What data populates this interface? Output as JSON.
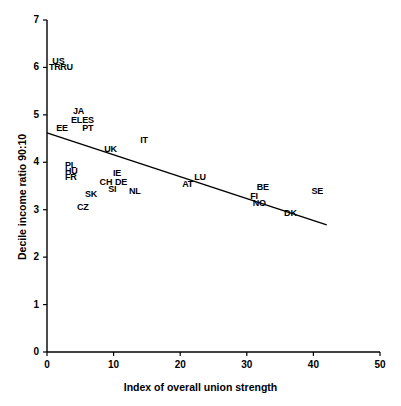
{
  "chart_data": {
    "type": "scatter",
    "title": "",
    "xlabel": "Index of overall union strength",
    "ylabel": "Decile income ratio 90:10",
    "xlim": [
      0,
      50
    ],
    "ylim": [
      0,
      7
    ],
    "xticks": [
      "0",
      "10",
      "20",
      "30",
      "40",
      "50"
    ],
    "yticks": [
      "0",
      "1",
      "2",
      "3",
      "4",
      "5",
      "6",
      "7"
    ],
    "grid": false,
    "legend": "none",
    "marker": "text-label-only",
    "points": [
      {
        "label": "US",
        "x": 0.5,
        "y": 6.12
      },
      {
        "label": "TR",
        "x": 0.0,
        "y": 5.98
      },
      {
        "label": "RU",
        "x": 1.7,
        "y": 5.98
      },
      {
        "label": "JA",
        "x": 3.6,
        "y": 5.06
      },
      {
        "label": "EL",
        "x": 3.3,
        "y": 4.88
      },
      {
        "label": "ES",
        "x": 5.0,
        "y": 4.88
      },
      {
        "label": "EE",
        "x": 1.1,
        "y": 4.71
      },
      {
        "label": "PT",
        "x": 5.0,
        "y": 4.71
      },
      {
        "label": "IT",
        "x": 13.7,
        "y": 4.45
      },
      {
        "label": "UK",
        "x": 8.3,
        "y": 4.25
      },
      {
        "label": "PL",
        "x": 2.4,
        "y": 3.93
      },
      {
        "label": "HU",
        "x": 2.4,
        "y": 3.79
      },
      {
        "label": "IE",
        "x": 9.6,
        "y": 3.76
      },
      {
        "label": "FR",
        "x": 2.4,
        "y": 3.66
      },
      {
        "label": "LU",
        "x": 21.8,
        "y": 3.66
      },
      {
        "label": "CH",
        "x": 7.6,
        "y": 3.57
      },
      {
        "label": "DE",
        "x": 9.9,
        "y": 3.57
      },
      {
        "label": "AT",
        "x": 20.0,
        "y": 3.53
      },
      {
        "label": "BE",
        "x": 31.2,
        "y": 3.46
      },
      {
        "label": "SI",
        "x": 8.9,
        "y": 3.41
      },
      {
        "label": "NL",
        "x": 12.0,
        "y": 3.37
      },
      {
        "label": "SE",
        "x": 39.4,
        "y": 3.37
      },
      {
        "label": "SK",
        "x": 5.4,
        "y": 3.3
      },
      {
        "label": "FI",
        "x": 30.2,
        "y": 3.26
      },
      {
        "label": "NO",
        "x": 30.6,
        "y": 3.11
      },
      {
        "label": "CZ",
        "x": 4.2,
        "y": 3.04
      },
      {
        "label": "DK",
        "x": 35.3,
        "y": 2.91
      }
    ],
    "trendline": {
      "x0": 0.0,
      "y0": 4.62,
      "x1": 42.0,
      "y1": 2.68
    }
  },
  "axes": {
    "x_title": "Index of overall union strength",
    "y_title": "Decile income ratio 90:10"
  }
}
